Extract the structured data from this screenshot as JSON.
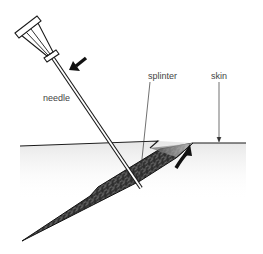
{
  "diagram": {
    "labels": {
      "needle": "needle",
      "splinter": "splinter",
      "skin": "skin"
    },
    "colors": {
      "line": "#1a1a1a",
      "splinter_fill": "#3a3a3a",
      "splinter_texture": "#8a8a8a",
      "label_text": "#444444",
      "skin_shade": "#ececec"
    },
    "icons": {
      "push_arrow": "straight-arrow-down-left",
      "lift_arrow": "curved-arrow-up-right",
      "skin_pointer": "thin-arrow-down",
      "splinter_pointer": "leader-line"
    }
  }
}
